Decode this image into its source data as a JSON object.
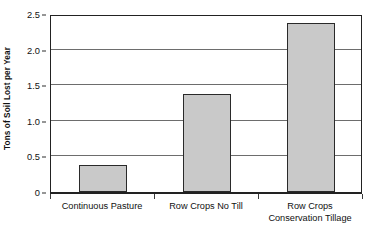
{
  "chart_data": {
    "type": "bar",
    "title": "",
    "subtitle": "",
    "xlabel": "",
    "ylabel": "Tons of Soil Lost per Year",
    "categories": [
      "Continuous Pasture",
      "Row Crops No Till",
      "Row Crops Conservation Tillage"
    ],
    "category_lines": [
      [
        "Continuous Pasture"
      ],
      [
        "Row Crops No Till"
      ],
      [
        "Row Crops",
        "Conservation Tillage"
      ]
    ],
    "values": [
      0.38,
      1.37,
      2.37
    ],
    "ylim": [
      0,
      2.5
    ],
    "ytick_labels": [
      "0",
      "0.5",
      "1.0",
      "1.5",
      "2.0",
      "2.5"
    ],
    "ytick_values": [
      0,
      0.5,
      1.0,
      1.5,
      2.0,
      2.5
    ],
    "grid": "horizontal",
    "legend": "none",
    "bar_fill_color": "#c9c9c9",
    "bar_edge_color": "#2a2a2a",
    "axis_color": "#222222",
    "gridline_color": "#6d6d6d",
    "background_color": "#ffffff"
  }
}
